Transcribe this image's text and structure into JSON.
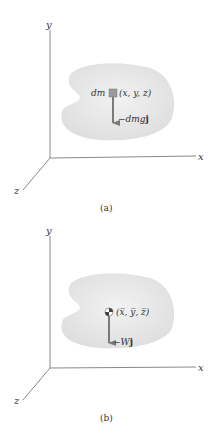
{
  "figures": [
    {
      "caption": "(a)",
      "axes": {
        "x": "x",
        "y": "y",
        "z": "z"
      },
      "element_label": "dm",
      "position_label": "(x, y, z)",
      "force_label_prefix": "−dmg",
      "force_label_unit": "j"
    },
    {
      "caption": "(b)",
      "axes": {
        "x": "x",
        "y": "y",
        "z": "z"
      },
      "position_label": "(x̅, y̅, z̅)",
      "force_label_prefix": "−W",
      "force_label_unit": "j"
    }
  ],
  "colors": {
    "axis": "#6a6a6a",
    "body_fill": "#e4e4e4",
    "arrow": "#7a7a7a",
    "text": "#333333"
  }
}
